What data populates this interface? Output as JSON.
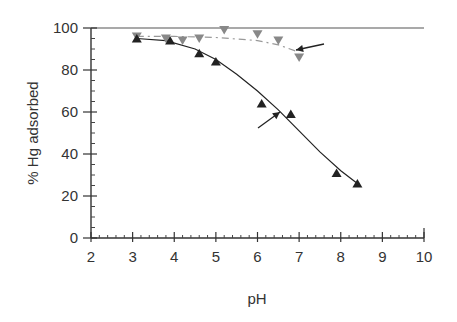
{
  "chart_data": {
    "type": "scatter",
    "title": "",
    "xlabel": "pH",
    "ylabel": "% Hg adsorbed",
    "xlim": [
      2,
      10
    ],
    "ylim": [
      0,
      100
    ],
    "xticks": [
      2,
      3,
      4,
      5,
      6,
      7,
      8,
      9,
      10
    ],
    "yticks": [
      0,
      20,
      40,
      60,
      80,
      100
    ],
    "grid": false,
    "legend": null,
    "series": [
      {
        "name": "upper (inverted triangles, dashed fit)",
        "marker": "triangle-down",
        "color": "#888888",
        "line_style": "dashed",
        "x": [
          3.1,
          3.8,
          4.2,
          4.6,
          5.2,
          6.0,
          6.5,
          7.0
        ],
        "y": [
          96,
          95,
          94,
          95,
          99,
          97,
          94,
          86
        ]
      },
      {
        "name": "lower (triangles, solid fit)",
        "marker": "triangle-up",
        "color": "#222222",
        "line_style": "solid",
        "x": [
          3.1,
          3.9,
          4.6,
          5.0,
          6.1,
          6.8,
          7.9,
          8.4
        ],
        "y": [
          95,
          94,
          88,
          84,
          64,
          59,
          31,
          26
        ]
      }
    ],
    "annotations": [
      {
        "type": "arrow",
        "points_to": "upper curve",
        "at": [
          6.9,
          89
        ]
      },
      {
        "type": "arrow",
        "points_to": "lower curve",
        "at": [
          6.4,
          60
        ]
      }
    ]
  }
}
